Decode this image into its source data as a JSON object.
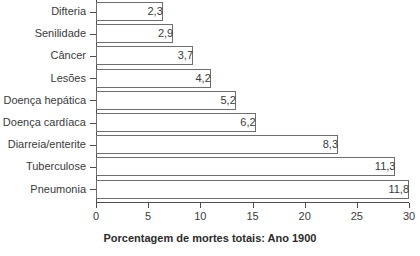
{
  "chart_data": {
    "type": "bar",
    "orientation": "horizontal",
    "title": "",
    "xlabel": "Porcentagem de mortes totais: Ano 1900",
    "ylabel": "",
    "xlim": [
      0,
      30
    ],
    "xticks": [
      0,
      5,
      10,
      15,
      20,
      25,
      30
    ],
    "xtick_labels": [
      "0",
      "5",
      "10",
      "15",
      "20",
      "25",
      "30"
    ],
    "grid": false,
    "legend": null,
    "decimal_separator": ",",
    "categories": [
      "Difteria",
      "Senilidade",
      "Câncer",
      "Lesões",
      "Doença hepática",
      "Doença cardíaca",
      "Diarreia/enterite",
      "Tuberculose",
      "Pneumonia"
    ],
    "values": [
      2.3,
      2.9,
      3.7,
      4.2,
      5.2,
      6.2,
      8.3,
      11.3,
      11.8
    ],
    "value_labels": [
      "2,3",
      "2,9",
      "3,7",
      "4,2",
      "5,2",
      "6,2",
      "8,3",
      "11,3",
      "11,8"
    ],
    "bar_extents_axis_units": [
      6.4,
      7.4,
      9.3,
      11.0,
      13.4,
      15.3,
      23.2,
      28.7,
      30.0
    ],
    "colors": {
      "bar_fill": "#ffffff",
      "bar_edge": "#6e6e6e",
      "axis": "#4d4d4d",
      "text": "#3a3a3a",
      "background": "#ffffff"
    }
  }
}
